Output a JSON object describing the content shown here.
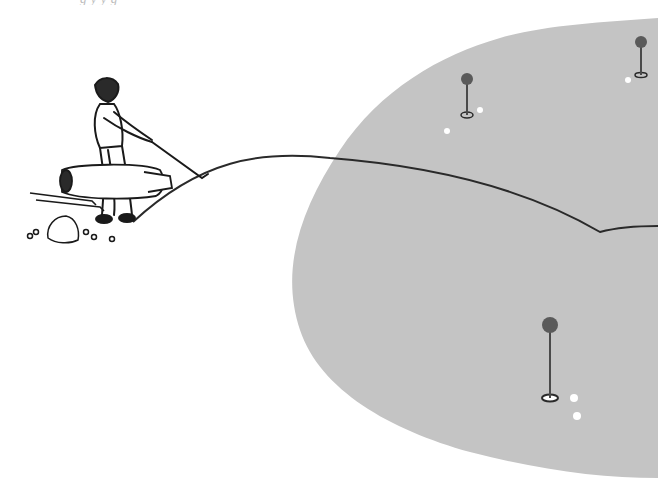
{
  "illustration": {
    "subject": "golfer swinging, ball trajectory onto putting green",
    "colors": {
      "background": "#ffffff",
      "green": "#c4c4c4",
      "ink": "#2a2a2a",
      "flag": "#5a5a5a",
      "ball": "#ffffff"
    },
    "top_text_fragment": "g      y           y      g"
  },
  "elements": {
    "golfer": "golfer-figure",
    "golf_bag": "golf-bag",
    "green": "putting-green",
    "trajectory": "ball-trajectory",
    "flags": [
      {
        "name": "flag-top-center",
        "x": 467,
        "y": 115
      },
      {
        "name": "flag-top-right",
        "x": 641,
        "y": 75
      },
      {
        "name": "flag-bottom",
        "x": 550,
        "y": 398
      }
    ],
    "balls": [
      {
        "x": 480,
        "y": 110
      },
      {
        "x": 447,
        "y": 131
      },
      {
        "x": 628,
        "y": 80
      },
      {
        "x": 574,
        "y": 398
      },
      {
        "x": 577,
        "y": 416
      },
      {
        "x": 112,
        "y": 239
      }
    ]
  }
}
